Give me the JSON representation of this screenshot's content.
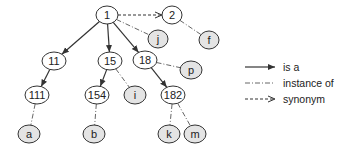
{
  "diagram": {
    "concept_fill": "#ffffff",
    "instance_fill": "#e4e4e4",
    "stroke": "#333333",
    "nodes": [
      {
        "id": "n1",
        "label": "1",
        "kind": "concept",
        "x": 107,
        "y": 15,
        "rx": 11
      },
      {
        "id": "n2",
        "label": "2",
        "kind": "concept",
        "x": 172,
        "y": 15,
        "rx": 10
      },
      {
        "id": "nj",
        "label": "j",
        "kind": "instance",
        "x": 158,
        "y": 39,
        "rx": 10
      },
      {
        "id": "nf",
        "label": "f",
        "kind": "instance",
        "x": 209,
        "y": 40,
        "rx": 10
      },
      {
        "id": "n11",
        "label": "11",
        "kind": "concept",
        "x": 54,
        "y": 61,
        "rx": 12
      },
      {
        "id": "n15",
        "label": "15",
        "kind": "concept",
        "x": 110,
        "y": 61,
        "rx": 12
      },
      {
        "id": "n18",
        "label": "18",
        "kind": "concept",
        "x": 145,
        "y": 60,
        "rx": 12
      },
      {
        "id": "np",
        "label": "p",
        "kind": "instance",
        "x": 191,
        "y": 70,
        "rx": 11
      },
      {
        "id": "n111",
        "label": "111",
        "kind": "concept",
        "x": 37,
        "y": 95,
        "rx": 12
      },
      {
        "id": "n154",
        "label": "154",
        "kind": "concept",
        "x": 97,
        "y": 95,
        "rx": 12
      },
      {
        "id": "ni",
        "label": "i",
        "kind": "instance",
        "x": 135,
        "y": 95,
        "rx": 11
      },
      {
        "id": "n182",
        "label": "182",
        "kind": "concept",
        "x": 173,
        "y": 95,
        "rx": 12
      },
      {
        "id": "na",
        "label": "a",
        "kind": "instance",
        "x": 29,
        "y": 134,
        "rx": 11
      },
      {
        "id": "nb",
        "label": "b",
        "kind": "instance",
        "x": 94,
        "y": 134,
        "rx": 11
      },
      {
        "id": "nk",
        "label": "k",
        "kind": "instance",
        "x": 169,
        "y": 134,
        "rx": 11
      },
      {
        "id": "nm",
        "label": "m",
        "kind": "instance",
        "x": 195,
        "y": 134,
        "rx": 11
      }
    ],
    "edges": [
      {
        "from": "n1",
        "to": "n2",
        "type": "synonym"
      },
      {
        "from": "n1",
        "to": "nj",
        "type": "instance_of"
      },
      {
        "from": "n2",
        "to": "nf",
        "type": "instance_of"
      },
      {
        "from": "n1",
        "to": "n11",
        "type": "is_a"
      },
      {
        "from": "n1",
        "to": "n15",
        "type": "is_a"
      },
      {
        "from": "n1",
        "to": "n18",
        "type": "is_a"
      },
      {
        "from": "n18",
        "to": "np",
        "type": "instance_of"
      },
      {
        "from": "n11",
        "to": "n111",
        "type": "is_a"
      },
      {
        "from": "n15",
        "to": "n154",
        "type": "is_a"
      },
      {
        "from": "n15",
        "to": "ni",
        "type": "instance_of"
      },
      {
        "from": "n18",
        "to": "n182",
        "type": "is_a"
      },
      {
        "from": "n111",
        "to": "na",
        "type": "instance_of"
      },
      {
        "from": "n154",
        "to": "nb",
        "type": "instance_of"
      },
      {
        "from": "n182",
        "to": "nk",
        "type": "instance_of"
      },
      {
        "from": "n182",
        "to": "nm",
        "type": "instance_of"
      }
    ]
  },
  "legend": {
    "items": [
      {
        "type": "is_a",
        "label": "is a"
      },
      {
        "type": "instance_of",
        "label": "instance of"
      },
      {
        "type": "synonym",
        "label": "synonym"
      }
    ]
  }
}
